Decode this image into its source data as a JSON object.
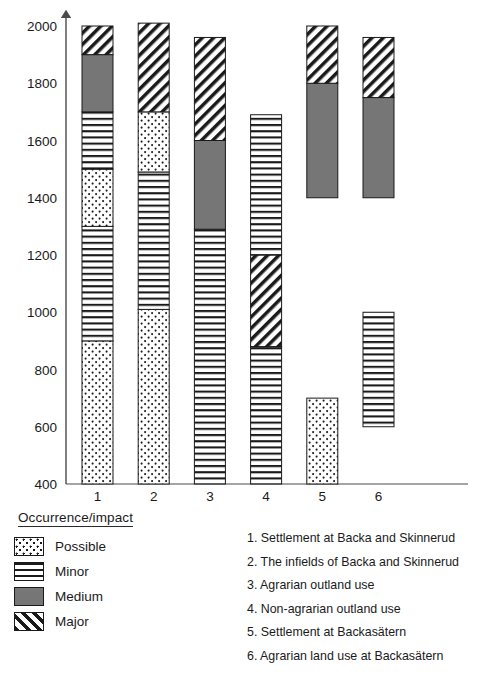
{
  "chart_data": {
    "type": "bar",
    "title": "",
    "subtitle": "",
    "xlabel": "",
    "ylabel": "",
    "ylim": [
      400,
      2000
    ],
    "ytick_step": 200,
    "yticks": [
      400,
      600,
      800,
      1000,
      1200,
      1400,
      1600,
      1800,
      2000
    ],
    "ytick_labels": [
      "400",
      "600",
      "800",
      "1000",
      "1200",
      "1400",
      "1600",
      "1800",
      "2000"
    ],
    "categories": [
      "1",
      "2",
      "3",
      "4",
      "5",
      "6"
    ],
    "grid": false,
    "legend_position": "bottom-left",
    "orientation": "vertical",
    "stacked": true,
    "note": "Stacked/floating bars; vertical axis is a calendar-year timeline (AD). Segments are year spans, some bars have gaps.",
    "series": [
      {
        "name": "Possible",
        "pattern": "dots"
      },
      {
        "name": "Minor",
        "pattern": "horizontal-lines"
      },
      {
        "name": "Medium",
        "pattern": "solid-gray"
      },
      {
        "name": "Major",
        "pattern": "diagonal-hatch"
      }
    ],
    "bars": [
      {
        "category": "1",
        "label": "Settlement at Backa and Skinnerud",
        "segments": [
          {
            "series": "Possible",
            "start": 400,
            "end": 900
          },
          {
            "series": "Minor",
            "start": 900,
            "end": 1300
          },
          {
            "series": "Possible",
            "start": 1300,
            "end": 1500
          },
          {
            "series": "Minor",
            "start": 1500,
            "end": 1700
          },
          {
            "series": "Medium",
            "start": 1700,
            "end": 1900
          },
          {
            "series": "Major",
            "start": 1900,
            "end": 2000
          }
        ]
      },
      {
        "category": "2",
        "label": "The infields of Backa and Skinnerud",
        "segments": [
          {
            "series": "Possible",
            "start": 400,
            "end": 1010
          },
          {
            "series": "Minor",
            "start": 1010,
            "end": 1490
          },
          {
            "series": "Possible",
            "start": 1490,
            "end": 1700
          },
          {
            "series": "Major",
            "start": 1700,
            "end": 2010
          }
        ]
      },
      {
        "category": "3",
        "label": "Agrarian outland use",
        "segments": [
          {
            "series": "Minor",
            "start": 400,
            "end": 1290
          },
          {
            "series": "Medium",
            "start": 1290,
            "end": 1600
          },
          {
            "series": "Major",
            "start": 1600,
            "end": 1960
          }
        ]
      },
      {
        "category": "4",
        "label": "Non-agrarian outland use",
        "segments": [
          {
            "series": "Minor",
            "start": 400,
            "end": 880
          },
          {
            "series": "Major",
            "start": 880,
            "end": 1200
          },
          {
            "series": "Minor",
            "start": 1200,
            "end": 1690
          }
        ]
      },
      {
        "category": "5",
        "label": "Settlement at Backasätern",
        "segments": [
          {
            "series": "Possible",
            "start": 400,
            "end": 700
          },
          {
            "series": "Medium",
            "start": 1400,
            "end": 1800
          },
          {
            "series": "Major",
            "start": 1800,
            "end": 2000
          }
        ]
      },
      {
        "category": "6",
        "label": "Agrarian land use at Backasätern",
        "segments": [
          {
            "series": "Minor",
            "start": 600,
            "end": 1000
          },
          {
            "series": "Medium",
            "start": 1400,
            "end": 1750
          },
          {
            "series": "Major",
            "start": 1750,
            "end": 1960
          }
        ]
      }
    ]
  },
  "legend": {
    "title": "Occurrence/impact",
    "items": [
      {
        "label": "Possible",
        "pattern": "dots"
      },
      {
        "label": "Minor",
        "pattern": "horizontal-lines"
      },
      {
        "label": "Medium",
        "pattern": "solid-gray"
      },
      {
        "label": "Major",
        "pattern": "diagonal-hatch"
      }
    ]
  },
  "keylist": {
    "items": [
      {
        "number": "1.",
        "text": "Settlement at Backa and Skinnerud"
      },
      {
        "number": "2.",
        "text": "The infields of Backa and Skinnerud"
      },
      {
        "number": "3.",
        "text": "Agrarian outland use"
      },
      {
        "number": "4.",
        "text": "Non-agrarian outland use"
      },
      {
        "number": "5.",
        "text": "Settlement at Backasätern"
      },
      {
        "number": "6.",
        "text": "Agrarian land use at Backasätern"
      }
    ]
  },
  "colors": {
    "axis": "#4a4a4a",
    "bar_outline": "#1a1a1a",
    "medium_fill": "#767676",
    "text": "#1a1a1a",
    "background": "#ffffff"
  }
}
